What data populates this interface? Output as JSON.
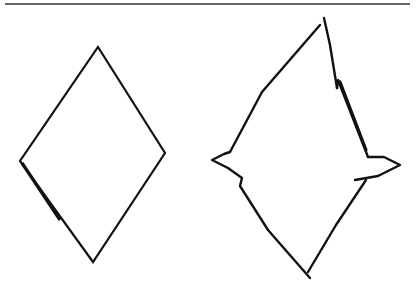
{
  "figure": {
    "stroke_color": "#111111",
    "background": "#ffffff",
    "shapes": [
      {
        "name": "plain-diamond",
        "points": [
          [
            98,
            47
          ],
          [
            165,
            153
          ],
          [
            93,
            262
          ],
          [
            20,
            161
          ]
        ]
      },
      {
        "name": "spiked-diamond",
        "points": [
          [
            320,
            25
          ],
          [
            230,
            152
          ],
          [
            212,
            160
          ],
          [
            242,
            178
          ],
          [
            240,
            186
          ],
          [
            310,
            278
          ],
          [
            366,
            180
          ],
          [
            400,
            165
          ],
          [
            368,
            157
          ],
          [
            336,
            80
          ],
          [
            324,
            18
          ]
        ]
      }
    ]
  }
}
